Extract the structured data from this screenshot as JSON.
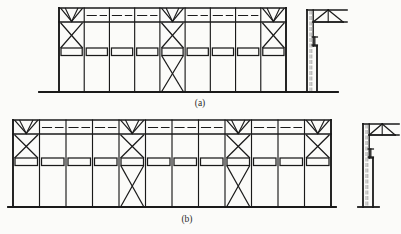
{
  "figure": {
    "background_color": "#fbfbf9",
    "line_color": "#1a1a1a",
    "hidden_line_color": "#9a9a9a",
    "panels": [
      {
        "id": "a",
        "caption": "(a)",
        "caption_x": 200,
        "caption_y": 106,
        "frame": {
          "x": 59,
          "y": 8,
          "width": 227,
          "height": 84,
          "bays": 9,
          "bay_width": 25.2
        },
        "ground_line": {
          "x1": 39,
          "x2": 338,
          "y": 92
        },
        "top_chord_y": 8,
        "eave_y": 22,
        "mid_rail_y": 48,
        "mid_rail_height": 7.5,
        "braced_bays": [
          1,
          5,
          9
        ],
        "full_height_braced_bays": [
          5
        ],
        "dashed_top_bays": [
          2,
          3,
          4,
          6,
          7,
          8
        ],
        "detail": {
          "label": "column-side-elevation",
          "x": 300,
          "y": 8,
          "column_x": 307,
          "column_width": 10,
          "column_top": 10,
          "column_base": 92,
          "bracket_y": 10,
          "bracket_width": 30,
          "bracket_height": 12,
          "beam_x2": 347,
          "splice_y": 46,
          "footing_y": 86
        }
      },
      {
        "id": "b",
        "caption": "(b)",
        "caption_x": 187,
        "caption_y": 222,
        "frame": {
          "x": 13,
          "y": 120,
          "width": 318,
          "height": 87,
          "bays": 12,
          "bay_width": 26.5
        },
        "ground_line": {
          "x1": 8,
          "x2": 336,
          "y": 207
        },
        "top_chord_y": 120,
        "eave_y": 134,
        "mid_rail_y": 158,
        "mid_rail_height": 7.5,
        "braced_bays": [
          1,
          5,
          9,
          12
        ],
        "full_height_braced_bays": [
          5,
          9
        ],
        "dashed_top_bays": [
          2,
          3,
          4,
          6,
          7,
          8,
          10,
          11
        ],
        "detail": {
          "label": "column-side-elevation",
          "x": 358,
          "y": 120,
          "column_x": 363,
          "column_width": 10,
          "column_top": 124,
          "column_base": 207,
          "bracket_y": 124,
          "bracket_width": 26,
          "bracket_height": 11,
          "beam_x2": 399,
          "splice_y": 158,
          "footing_y": 200
        }
      }
    ]
  }
}
